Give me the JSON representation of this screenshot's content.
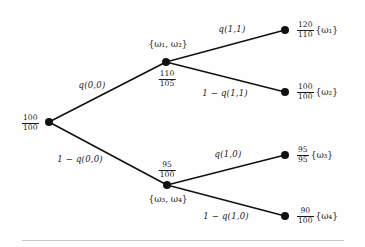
{
  "figure": {
    "type": "binomial-lattice-decision-tree",
    "root": {
      "value_top": "100",
      "value_bottom": "100"
    },
    "nodes": {
      "upper": {
        "set_label": "{ω₁, ω₂}",
        "value_top": "110",
        "value_bottom": "105"
      },
      "lower": {
        "set_label": "{ω₃, ω₄}",
        "value_top": "95",
        "value_bottom": "100"
      }
    },
    "edges": {
      "root_up": "q(0,0)",
      "root_down": "1 − q(0,0)",
      "upper_up": "q(1,1)",
      "upper_down": "1 − q(1,1)",
      "lower_up": "q(1,0)",
      "lower_down": "1 − q(1,0)"
    },
    "leaves": [
      {
        "name": "leaf-omega-1",
        "value_top": "120",
        "value_bottom": "110",
        "set_label": "{ω₁}"
      },
      {
        "name": "leaf-omega-2",
        "value_top": "100",
        "value_bottom": "100",
        "set_label": "{ω₂}"
      },
      {
        "name": "leaf-omega-3",
        "value_top": "95",
        "value_bottom": "95",
        "set_label": "{ω₃}"
      },
      {
        "name": "leaf-omega-4",
        "value_top": "90",
        "value_bottom": "100",
        "set_label": "{ω₄}"
      }
    ],
    "colors": {
      "ink": "#111111",
      "background": "#fefefe",
      "rule": "#c9c9c9"
    }
  }
}
